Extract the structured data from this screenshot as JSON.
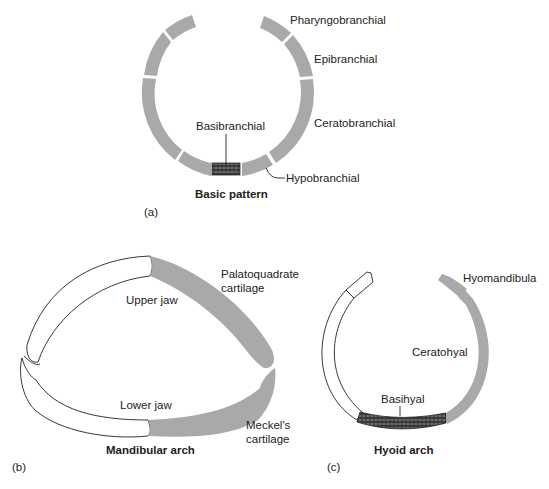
{
  "figure": {
    "panels": [
      {
        "id": "a",
        "panel_label": "(a)",
        "title": "Basic pattern",
        "labels": {
          "pharyngobranchial": "Pharyngobranchial",
          "epibranchial": "Epibranchial",
          "ceratobranchial": "Ceratobranchial",
          "basibranchial": "Basibranchial",
          "hypobranchial": "Hypobranchial"
        }
      },
      {
        "id": "b",
        "panel_label": "(b)",
        "title": "Mandibular arch",
        "labels": {
          "palatoquadrate_1": "Palatoquadrate",
          "palatoquadrate_2": "cartilage",
          "upper_jaw": "Upper jaw",
          "lower_jaw": "Lower jaw",
          "meckels_1": "Meckel's",
          "meckels_2": "cartilage"
        }
      },
      {
        "id": "c",
        "panel_label": "(c)",
        "title": "Hyoid arch",
        "labels": {
          "hyomandibula": "Hyomandibula",
          "ceratohyal": "Ceratohyal",
          "basihyal": "Basihyal"
        }
      }
    ],
    "colors": {
      "cartilage_gray": "#a9a9a9",
      "outline": "#222222",
      "background": "#ffffff"
    }
  }
}
